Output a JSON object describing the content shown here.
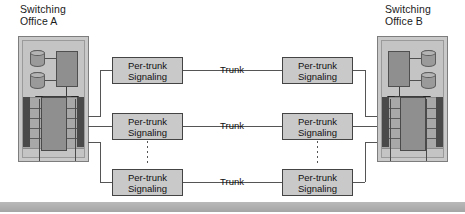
{
  "diagram": {
    "offices": [
      {
        "id": "a",
        "caption": "Switching\nOffice A"
      },
      {
        "id": "b",
        "caption": "Switching\nOffice B"
      }
    ],
    "trunk_label": "Trunk",
    "signaling_label": "Per-trunk\nSignaling",
    "rows": [
      {
        "index": 1,
        "left_box": "Per-trunk\nSignaling",
        "trunk": "Trunk",
        "right_box": "Per-trunk\nSignaling"
      },
      {
        "index": 2,
        "left_box": "Per-trunk\nSignaling",
        "trunk": "Trunk",
        "right_box": "Per-trunk\nSignaling"
      },
      {
        "index": 3,
        "left_box": "Per-trunk\nSignaling",
        "trunk": "Trunk",
        "right_box": "Per-trunk\nSignaling"
      }
    ],
    "continuation": "vertical-dotted-ellipsis",
    "colors": {
      "page_background": "#ffffff",
      "box_fill": "#c9c9c9",
      "box_border": "#444444",
      "office_fill": "#c4c4c4",
      "office_border": "#7d7d7d",
      "fabric_dark": "#4a4a4a",
      "fabric_band": "#a8a8a8",
      "component_fill": "#8f8f8f",
      "line": "#555555",
      "text": "#111111",
      "bottom_bar": "#b0b0b0"
    }
  }
}
